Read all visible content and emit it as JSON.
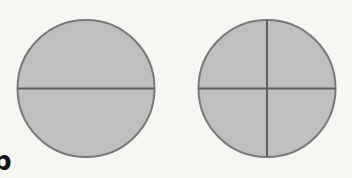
{
  "figure": {
    "background_color": "#f7f6f3",
    "fill_color": "#bfbfbf",
    "stroke_color": "#737373",
    "divider_color": "#5e5e5e",
    "shapes": [
      {
        "name": "circle-halves",
        "label": "Circle divided into 2 equal parts",
        "center_x": 86,
        "center_y": 88.5,
        "radius": 69,
        "parts": 2,
        "shaded_parts": 2,
        "dividers": [
          "horizontal"
        ]
      },
      {
        "name": "circle-quarters",
        "label": "Circle divided into 4 equal parts",
        "center_x": 267,
        "center_y": 88.5,
        "radius": 69,
        "parts": 4,
        "shaded_parts": 4,
        "dividers": [
          "horizontal",
          "vertical"
        ]
      }
    ]
  },
  "corner_mark": {
    "glyph": "b",
    "description": "partially cropped dark character at bottom-left edge"
  }
}
